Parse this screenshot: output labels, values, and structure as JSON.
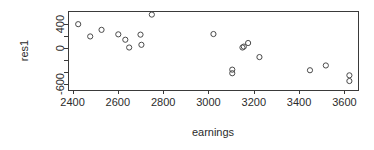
{
  "chart_data": {
    "type": "scatter",
    "title": "",
    "xlabel": "earnings",
    "ylabel": "res1",
    "xlim": [
      2380,
      3660
    ],
    "ylim": [
      -700,
      620
    ],
    "grid": false,
    "legend": null,
    "x_ticks": [
      2400,
      2600,
      2800,
      3000,
      3200,
      3400,
      3600
    ],
    "x_tick_labels": [
      "2400",
      "2600",
      "2800",
      "3000",
      "3200",
      "3400",
      "3600"
    ],
    "y_ticks": [
      -600,
      -400,
      -200,
      0,
      200,
      400
    ],
    "y_tick_labels": [
      "-600",
      "",
      "",
      "0",
      "",
      "400"
    ],
    "y_labeled_ticks": [
      {
        "value": 400,
        "label": "400"
      },
      {
        "value": 0,
        "label": "0"
      },
      {
        "value": -600,
        "label": "-600"
      }
    ],
    "marker": "open-circle",
    "marker_color": "#4a4a4a",
    "points": [
      {
        "x": 2425,
        "y": 400
      },
      {
        "x": 2478,
        "y": 195
      },
      {
        "x": 2528,
        "y": 305
      },
      {
        "x": 2602,
        "y": 230
      },
      {
        "x": 2633,
        "y": 140
      },
      {
        "x": 2650,
        "y": 10
      },
      {
        "x": 2700,
        "y": 225
      },
      {
        "x": 2704,
        "y": 55
      },
      {
        "x": 2750,
        "y": 560
      },
      {
        "x": 3022,
        "y": 235
      },
      {
        "x": 3150,
        "y": 10
      },
      {
        "x": 3156,
        "y": 25
      },
      {
        "x": 3175,
        "y": 85
      },
      {
        "x": 3105,
        "y": -360
      },
      {
        "x": 3105,
        "y": -420
      },
      {
        "x": 3225,
        "y": -150
      },
      {
        "x": 3448,
        "y": -370
      },
      {
        "x": 3518,
        "y": -290
      },
      {
        "x": 3622,
        "y": -455
      },
      {
        "x": 3622,
        "y": -550
      }
    ]
  }
}
